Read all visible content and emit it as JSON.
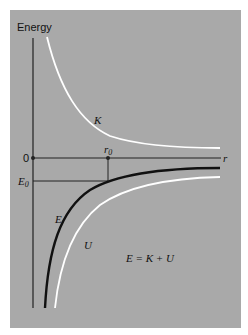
{
  "diagram": {
    "y_axis_label": "Energy",
    "x_axis_label": "r",
    "origin_label": "0",
    "r0_label": "r",
    "r0_subscript": "0",
    "E0_label": "E",
    "E0_subscript": "0",
    "curves": [
      {
        "name": "K",
        "label": "K",
        "color": "#ffffff",
        "description": "kinetic energy"
      },
      {
        "name": "E",
        "label": "E",
        "color": "#111111",
        "description": "total energy"
      },
      {
        "name": "U",
        "label": "U",
        "color": "#ffffff",
        "description": "potential energy"
      }
    ],
    "equation": "E = K + U",
    "colors": {
      "background": "#a9a9a9",
      "axis": "#222222"
    }
  }
}
